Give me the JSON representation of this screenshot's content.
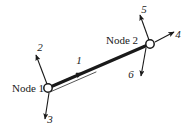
{
  "figure": {
    "background_color": "#ffffff",
    "stroke_color": "#1a1a1a",
    "width": 194,
    "height": 132
  },
  "nodes": [
    {
      "id": "node-1",
      "label": "Node 1",
      "x": 48,
      "y": 88,
      "radius": 4.2,
      "label_x": 12,
      "label_y": 92,
      "label_anchor": "start"
    },
    {
      "id": "node-2",
      "label": "Node 2",
      "x": 150,
      "y": 44,
      "radius": 4.2,
      "label_x": 106,
      "label_y": 44,
      "label_anchor": "start"
    }
  ],
  "beam": {
    "name": "beam-element",
    "x1": 48,
    "y1": 88,
    "x2": 150,
    "y2": 44
  },
  "dof_arrows": [
    {
      "id": "dof-1",
      "label": "1",
      "node": "node-1",
      "description": "axial translation along beam axis",
      "x1": 54,
      "y1": 85,
      "x2": 82,
      "y2": 73,
      "label_x": 79,
      "label_y": 64
    },
    {
      "id": "dof-2",
      "label": "2",
      "node": "node-1",
      "description": "transverse translation up-left",
      "x1": 47,
      "y1": 84,
      "x2": 36,
      "y2": 55,
      "label_x": 40,
      "label_y": 51
    },
    {
      "id": "dof-3",
      "label": "3",
      "node": "node-1",
      "description": "rotation / downward arrow",
      "x1": 49,
      "y1": 93,
      "x2": 45,
      "y2": 119,
      "label_x": 50,
      "label_y": 123
    },
    {
      "id": "dof-4",
      "label": "4",
      "node": "node-2",
      "description": "axial translation along beam axis",
      "x1": 155,
      "y1": 42,
      "x2": 174,
      "y2": 32,
      "label_x": 178,
      "label_y": 38
    },
    {
      "id": "dof-5",
      "label": "5",
      "node": "node-2",
      "description": "transverse translation up-left",
      "x1": 149,
      "y1": 40,
      "x2": 140,
      "y2": 15,
      "label_x": 144,
      "label_y": 13
    },
    {
      "id": "dof-6",
      "label": "6",
      "node": "node-2",
      "description": "rotation / downward arrow",
      "x1": 146,
      "y1": 48,
      "x2": 141,
      "y2": 76,
      "label_x": 131,
      "label_y": 78
    }
  ]
}
